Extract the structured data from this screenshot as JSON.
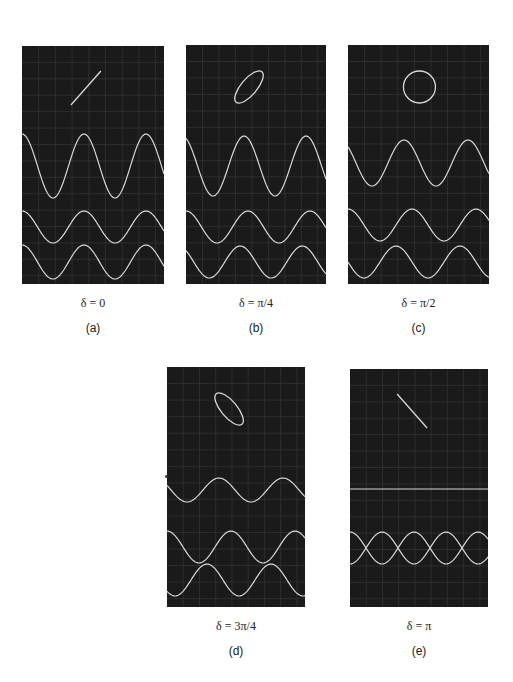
{
  "figure": {
    "colors": {
      "screen_bg": "#1a1a1a",
      "grid": "#3a3a3a",
      "trace": "#d8d8d8",
      "page_bg": "#ffffff"
    },
    "panels": [
      {
        "id": "a",
        "delta_label": "δ = 0",
        "sub_label": "(a)",
        "x": 22,
        "y": 46,
        "w": 142,
        "h": 238,
        "lissajous": {
          "shape": "line",
          "angle": "positive",
          "phase": 0
        },
        "wave_top": {
          "y_center": 166,
          "amp": 32,
          "period": 62,
          "phase": 0
        },
        "wave_mid": {
          "y_center": 227,
          "amp": 16,
          "period": 62,
          "phase": 0
        },
        "wave_bot": {
          "y_center": 262,
          "amp": 17,
          "period": 62,
          "phase": 0
        }
      },
      {
        "id": "b",
        "delta_label": "δ = π/4",
        "sub_label": "(b)",
        "x": 186,
        "y": 45,
        "w": 140,
        "h": 239,
        "lissajous": {
          "shape": "ellipse",
          "angle": "positive",
          "phase": 0.785
        },
        "wave_top": {
          "y_center": 166,
          "amp": 30,
          "period": 62,
          "phase": 0.4
        },
        "wave_mid": {
          "y_center": 227,
          "amp": 16,
          "period": 62,
          "phase": 0
        },
        "wave_bot": {
          "y_center": 262,
          "amp": 16,
          "period": 62,
          "phase": 0.785
        }
      },
      {
        "id": "c",
        "delta_label": "δ = π/2",
        "sub_label": "(c)",
        "x": 348,
        "y": 45,
        "w": 141,
        "h": 239,
        "lissajous": {
          "shape": "circle",
          "angle": "none",
          "phase": 1.571
        },
        "wave_top": {
          "y_center": 163,
          "amp": 23,
          "period": 64,
          "phase": 0.785
        },
        "wave_mid": {
          "y_center": 225,
          "amp": 16,
          "period": 64,
          "phase": 0
        },
        "wave_bot": {
          "y_center": 262,
          "amp": 16,
          "period": 64,
          "phase": 1.571
        }
      },
      {
        "id": "d",
        "delta_label": "δ = 3π/4",
        "sub_label": "(d)",
        "x": 167,
        "y": 367,
        "w": 138,
        "h": 240,
        "lissajous": {
          "shape": "ellipse",
          "angle": "negative",
          "phase": 2.356
        },
        "wave_top": {
          "y_center": 490,
          "amp": 12,
          "period": 64,
          "phase": 1.178
        },
        "wave_mid": {
          "y_center": 547,
          "amp": 16,
          "period": 64,
          "phase": 0
        },
        "wave_bot": {
          "y_center": 580,
          "amp": 16,
          "period": 64,
          "phase": 2.356
        }
      },
      {
        "id": "e",
        "delta_label": "δ = π",
        "sub_label": "(e)",
        "x": 350,
        "y": 369,
        "w": 138,
        "h": 238,
        "lissajous": {
          "shape": "line",
          "angle": "negative",
          "phase": 3.1416
        },
        "wave_top": {
          "y_center": 489,
          "amp": 0,
          "period": 64,
          "phase": 0
        },
        "wave_mid": {
          "y_center": 548,
          "amp": 16,
          "period": 64,
          "phase": 0
        },
        "wave_bot": {
          "y_center": 548,
          "amp": 16,
          "period": 64,
          "phase": 3.1416
        }
      }
    ]
  }
}
